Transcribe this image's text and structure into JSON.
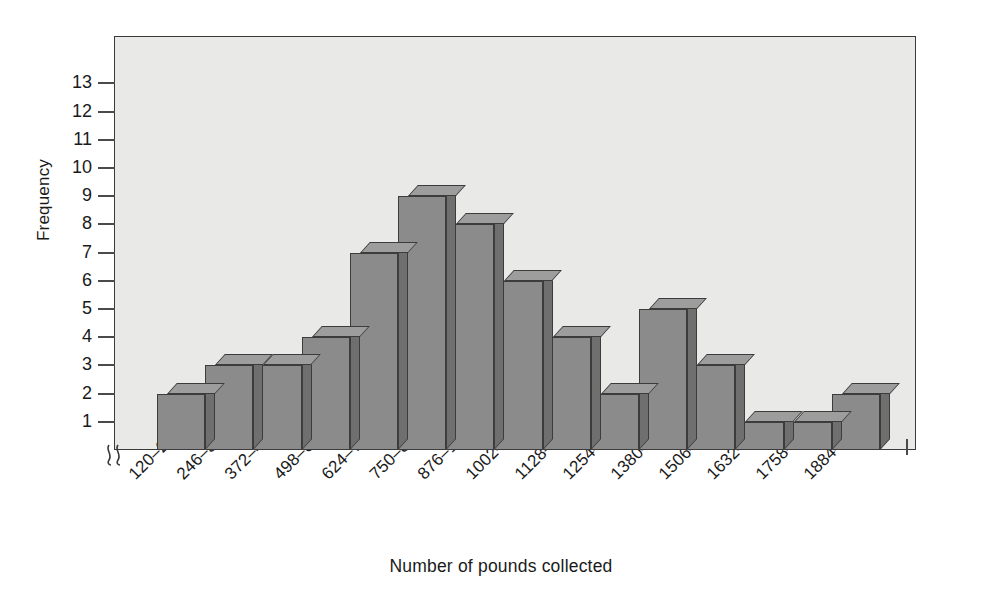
{
  "chart_data": {
    "type": "bar",
    "title": "",
    "xlabel": "Number of pounds collected",
    "ylabel": "Frequency",
    "categories": [
      "120–245",
      "246–371",
      "372–497",
      "498–623",
      "624–749",
      "750–875",
      "876–1001",
      "1002–1127",
      "1128–1253",
      "1254–1379",
      "1380–1505",
      "1506–1631",
      "1632–1757",
      "1758–1883",
      "1884–2009"
    ],
    "values": [
      2,
      3,
      3,
      4,
      7,
      9,
      8,
      6,
      4,
      2,
      5,
      3,
      1,
      1,
      2
    ],
    "ylim": [
      0,
      13.8
    ],
    "yticks": [
      1,
      2,
      3,
      4,
      5,
      6,
      7,
      8,
      9,
      10,
      11,
      12,
      13
    ],
    "ytick_labels": [
      "1",
      "2",
      "3",
      "4",
      "5",
      "6",
      "7",
      "8",
      "9",
      "10",
      "11",
      "12",
      "13"
    ],
    "grid": false,
    "legend": null,
    "axis_break": "y-axis break symbol at origin",
    "style": "3d-bars",
    "colors": {
      "bar_face": "#8b8b8b",
      "bar_top": "#9d9d9d",
      "bar_side": "#6f6f6f",
      "bar_edge": "#3c3c3c",
      "plot_background": "#e9e9e7",
      "frame": "#3a3a3a",
      "text": "#1a1a1a"
    }
  }
}
